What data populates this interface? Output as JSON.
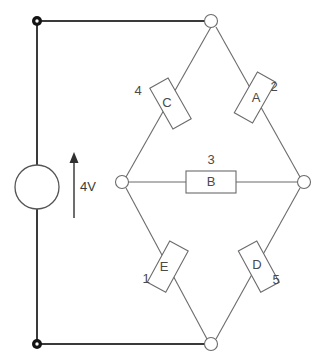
{
  "diagram": {
    "source": {
      "label": "4V",
      "arrow_direction": "up"
    },
    "resistors": [
      {
        "letter": "A",
        "number": "2",
        "branch": "top-right"
      },
      {
        "letter": "B",
        "number": "3",
        "branch": "middle-horizontal"
      },
      {
        "letter": "C",
        "number": "4",
        "branch": "top-left"
      },
      {
        "letter": "D",
        "number": "5",
        "branch": "bottom-right"
      },
      {
        "letter": "E",
        "number": "1",
        "branch": "bottom-left"
      }
    ],
    "colors": {
      "wire": "#3a3a3a",
      "branch": "#6b6b6b",
      "terminal": "#141414",
      "background": "#ffffff"
    }
  }
}
